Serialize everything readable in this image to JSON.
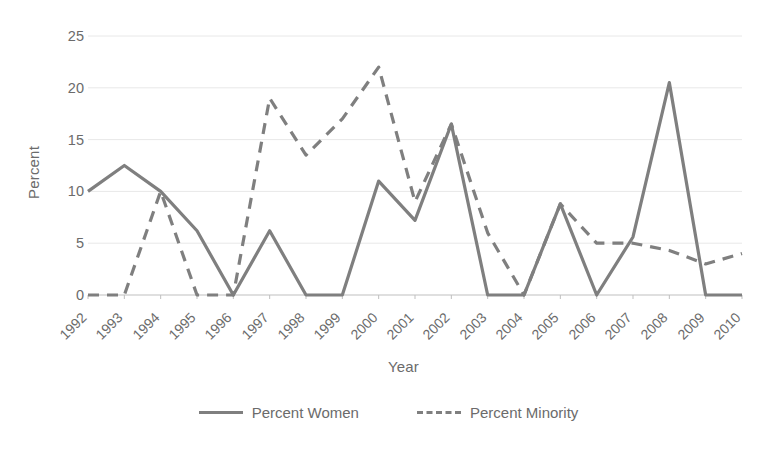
{
  "chart_data": {
    "type": "line",
    "title": "",
    "xlabel": "Year",
    "ylabel": "Percent",
    "categories": [
      "1992",
      "1993",
      "1994",
      "1995",
      "1996",
      "1997",
      "1998",
      "1999",
      "2000",
      "2001",
      "2002",
      "2003",
      "2004",
      "2005",
      "2006",
      "2007",
      "2008",
      "2009",
      "2010"
    ],
    "series": [
      {
        "name": "Percent Women",
        "style": "solid",
        "color": "#7f7f7f",
        "values": [
          10,
          12.5,
          10,
          6.2,
          0,
          6.2,
          0,
          0,
          11,
          7.2,
          16.5,
          0,
          0,
          8.8,
          0,
          5.6,
          20.5,
          0,
          0
        ]
      },
      {
        "name": "Percent Minority",
        "style": "dashed",
        "color": "#7f7f7f",
        "values": [
          0,
          0,
          10,
          0,
          0,
          19,
          13.5,
          17,
          22,
          9,
          16.5,
          6,
          0,
          8.8,
          5,
          5,
          4.3,
          3,
          4
        ]
      }
    ],
    "ylim": [
      0,
      25
    ],
    "yticks": [
      0,
      5,
      10,
      15,
      20,
      25
    ],
    "grid": "horizontal",
    "legend_position": "bottom",
    "plot_bg": "#ffffff",
    "gridline_color": "#e8e8e8",
    "axis_color": "#bfbfbf"
  },
  "legend": {
    "items": [
      {
        "label": "Percent Women",
        "style": "solid"
      },
      {
        "label": "Percent Minority",
        "style": "dashed"
      }
    ]
  }
}
